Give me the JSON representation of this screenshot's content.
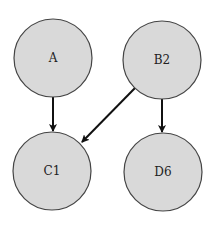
{
  "diagram": {
    "type": "directed-graph",
    "nodes": [
      {
        "id": "A",
        "label": "A",
        "cx": 53,
        "cy": 58,
        "r": 39
      },
      {
        "id": "B2",
        "label": "B2",
        "cx": 162,
        "cy": 60,
        "r": 39
      },
      {
        "id": "C1",
        "label": "C1",
        "cx": 52,
        "cy": 171,
        "r": 39
      },
      {
        "id": "D6",
        "label": "D6",
        "cx": 163,
        "cy": 172,
        "r": 39
      }
    ],
    "edges": [
      {
        "from": "A",
        "to": "C1"
      },
      {
        "from": "B2",
        "to": "C1"
      },
      {
        "from": "B2",
        "to": "D6"
      }
    ],
    "colors": {
      "node_fill": "#d9d9d9",
      "node_stroke": "#444444",
      "edge": "#111111"
    }
  }
}
